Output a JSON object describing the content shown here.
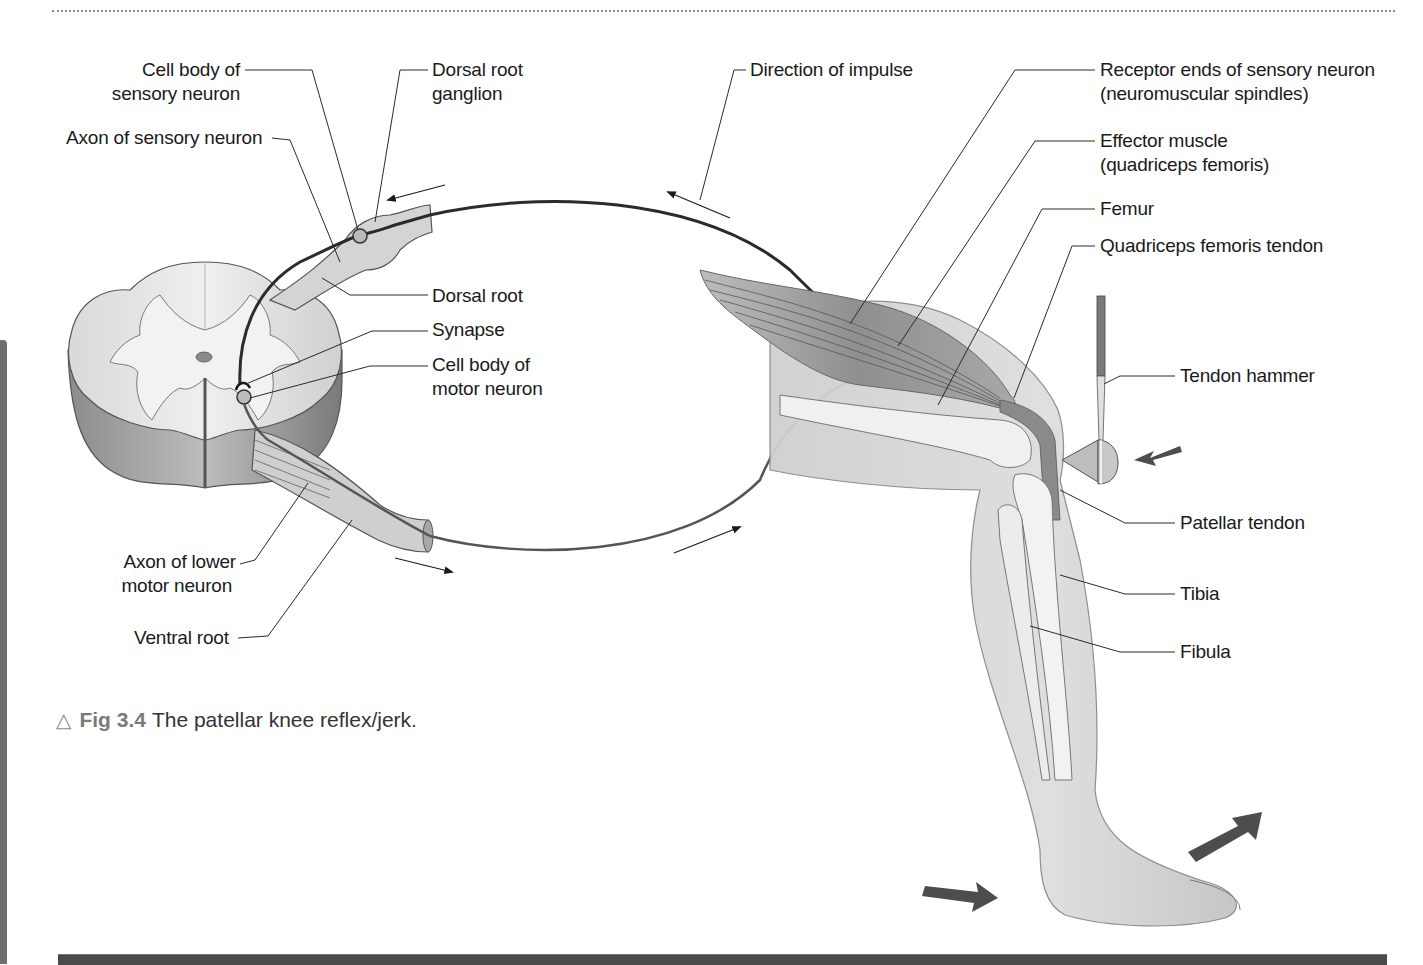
{
  "figure": {
    "caption_number": "Fig 3.4",
    "caption_text": "The patellar knee reflex/jerk.",
    "caption_icon": "triangle-outline-icon"
  },
  "labels": {
    "cell_body_sensory": [
      "Cell body of",
      "sensory neuron"
    ],
    "axon_sensory": "Axon of sensory neuron",
    "dorsal_root_ganglion": [
      "Dorsal root",
      "ganglion"
    ],
    "dorsal_root": "Dorsal root",
    "synapse": "Synapse",
    "cell_body_motor": [
      "Cell body of",
      "motor neuron"
    ],
    "axon_lower_motor": [
      "Axon of lower",
      "motor neuron"
    ],
    "ventral_root": "Ventral root",
    "direction_of_impulse": "Direction of impulse",
    "receptor_ends": [
      "Receptor ends of sensory neuron",
      "(neuromuscular spindles)"
    ],
    "effector_muscle": [
      "Effector muscle",
      "(quadriceps femoris)"
    ],
    "femur": "Femur",
    "quadriceps_tendon": "Quadriceps femoris tendon",
    "tendon_hammer": "Tendon hammer",
    "patellar_tendon": "Patellar tendon",
    "tibia": "Tibia",
    "fibula": "Fibula"
  },
  "colors": {
    "ink": "#1a1a1a",
    "leader": "#2a2a2a",
    "tissue_light": "#e6e6e6",
    "tissue_mid": "#c8c8c8",
    "tissue_dark": "#8a8a8a",
    "muscle": "#9a9a9a",
    "arrow_block": "#4d4d4d",
    "nerve_sensory": "#2b2b2b",
    "nerve_motor": "#555555"
  }
}
